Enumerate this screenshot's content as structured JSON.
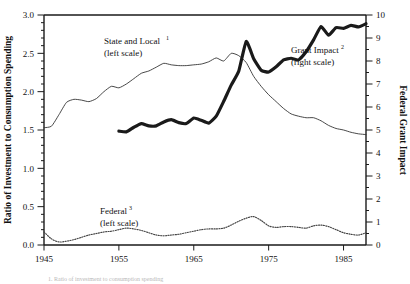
{
  "chart_data": {
    "type": "line",
    "title": "",
    "xlabel": "",
    "ylabel": "Ratio of Investment to Consumption Spending",
    "y2label": "Federal Grant Impact",
    "xlim": [
      1945,
      1988
    ],
    "ylim": [
      0.0,
      3.0
    ],
    "y2lim": [
      0,
      10
    ],
    "grid": false,
    "legend_position": "inline-annotations",
    "xticks": [
      1945,
      1955,
      1965,
      1975,
      1985
    ],
    "xtick_labels": [
      "1945",
      "1955",
      "1965",
      "1975",
      "1985"
    ],
    "yticks": [
      0.0,
      0.5,
      1.0,
      1.5,
      2.0,
      2.5,
      3.0
    ],
    "ytick_labels": [
      "0.0",
      "0.5",
      "1.0",
      "1.5",
      "2.0",
      "2.5",
      "3.0"
    ],
    "y2ticks": [
      0,
      1,
      2,
      3,
      4,
      5,
      6,
      7,
      8,
      9,
      10
    ],
    "y2tick_labels": [
      "0",
      "1",
      "2",
      "3",
      "4",
      "5",
      "6",
      "7",
      "8",
      "9",
      "10"
    ],
    "y_minor_interval": 0.1,
    "y2_minor_interval": 0.5,
    "series": [
      {
        "name": "State and Local",
        "footnote_marker": "1",
        "scale": "left",
        "scale_note": "(left scale)",
        "style": "thin-solid",
        "color": "#333333",
        "x": [
          1945,
          1946,
          1947,
          1948,
          1949,
          1950,
          1951,
          1952,
          1953,
          1954,
          1955,
          1956,
          1957,
          1958,
          1959,
          1960,
          1961,
          1962,
          1963,
          1964,
          1965,
          1966,
          1967,
          1968,
          1969,
          1970,
          1971,
          1972,
          1973,
          1974,
          1975,
          1976,
          1977,
          1978,
          1979,
          1980,
          1981,
          1982,
          1983,
          1984,
          1985,
          1986,
          1987,
          1988
        ],
        "values": [
          1.53,
          1.55,
          1.7,
          1.86,
          1.9,
          1.89,
          1.87,
          1.91,
          2.0,
          2.07,
          2.05,
          2.1,
          2.17,
          2.24,
          2.27,
          2.32,
          2.37,
          2.35,
          2.34,
          2.34,
          2.35,
          2.36,
          2.39,
          2.44,
          2.4,
          2.5,
          2.47,
          2.38,
          2.2,
          2.07,
          1.96,
          1.87,
          1.78,
          1.71,
          1.68,
          1.66,
          1.66,
          1.62,
          1.56,
          1.52,
          1.5,
          1.47,
          1.45,
          1.44
        ]
      },
      {
        "name": "Grant Impact",
        "footnote_marker": "2",
        "scale": "right",
        "scale_note": "(right scale)",
        "style": "thick-solid",
        "color": "#1a1a1a",
        "x": [
          1955,
          1956,
          1957,
          1958,
          1959,
          1960,
          1961,
          1962,
          1963,
          1964,
          1965,
          1966,
          1967,
          1968,
          1969,
          1970,
          1971,
          1972,
          1973,
          1974,
          1975,
          1976,
          1977,
          1978,
          1979,
          1980,
          1981,
          1982,
          1983,
          1984,
          1985,
          1986,
          1987,
          1988
        ],
        "values": [
          4.95,
          4.92,
          5.12,
          5.28,
          5.18,
          5.18,
          5.35,
          5.45,
          5.32,
          5.28,
          5.52,
          5.42,
          5.3,
          5.6,
          6.25,
          6.95,
          7.55,
          8.85,
          8.1,
          7.6,
          7.52,
          7.75,
          8.05,
          8.12,
          8.05,
          8.4,
          8.92,
          9.5,
          9.12,
          9.45,
          9.42,
          9.55,
          9.48,
          9.62
        ]
      },
      {
        "name": "Federal",
        "footnote_marker": "3",
        "scale": "left",
        "scale_note": "(left scale)",
        "style": "dotted",
        "color": "#444444",
        "x": [
          1945,
          1946,
          1947,
          1948,
          1949,
          1950,
          1951,
          1952,
          1953,
          1954,
          1955,
          1956,
          1957,
          1958,
          1959,
          1960,
          1961,
          1962,
          1963,
          1964,
          1965,
          1966,
          1967,
          1968,
          1969,
          1970,
          1971,
          1972,
          1973,
          1974,
          1975,
          1976,
          1977,
          1978,
          1979,
          1980,
          1981,
          1982,
          1983,
          1984,
          1985,
          1986,
          1987,
          1988
        ],
        "values": [
          0.17,
          0.08,
          0.04,
          0.05,
          0.07,
          0.1,
          0.13,
          0.15,
          0.17,
          0.18,
          0.2,
          0.22,
          0.21,
          0.19,
          0.16,
          0.13,
          0.12,
          0.13,
          0.14,
          0.16,
          0.18,
          0.2,
          0.21,
          0.21,
          0.22,
          0.26,
          0.31,
          0.35,
          0.37,
          0.32,
          0.25,
          0.23,
          0.24,
          0.24,
          0.23,
          0.22,
          0.25,
          0.26,
          0.24,
          0.2,
          0.16,
          0.14,
          0.13,
          0.16
        ]
      }
    ]
  },
  "axes": {
    "left_title": "Ratio of Investment to Consumption Spending",
    "right_title": "Federal Grant Impact"
  },
  "annotations": {
    "state_local": {
      "line1": "State and Local",
      "sup": "1",
      "line2": "(left scale)"
    },
    "grant_impact": {
      "line1": "Grant Impact",
      "sup": "2",
      "line2": "(right scale)"
    },
    "federal": {
      "line1": "Federal",
      "sup": "3",
      "line2": "(left scale)"
    }
  },
  "footnote": {
    "text": "1. Ratio of investment to consumption spending"
  }
}
